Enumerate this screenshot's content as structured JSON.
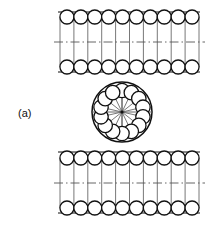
{
  "figure": {
    "label": "(a)",
    "label_x": 18,
    "label_y": 117,
    "caption_text": "(a)",
    "background_color": "#ffffff",
    "stroke_color": "#111111",
    "light_stroke_color": "#555555",
    "centerline_color": "#555555",
    "fill_color": "#ffffff",
    "title": "",
    "type": "line-diagram"
  },
  "chart_data": {
    "type": "diagram",
    "title": "(a)",
    "elements": [
      "upper-raceway-block",
      "central-wheel",
      "lower-raceway-block",
      "figure-label"
    ]
  },
  "upper_block": {
    "name": "upper-raceway-block",
    "x_left": 60,
    "x_right": 199,
    "y_top": 14,
    "y_bottom": 70,
    "roller_count_per_row": 10,
    "roller_radius": 7.0,
    "row_top_cy": 17,
    "row_bottom_cy": 67,
    "centerline_y": 42,
    "column_count": 10,
    "edge_line_top_y": 12,
    "edge_line_bottom_y": 72
  },
  "lower_block": {
    "name": "lower-raceway-block",
    "x_left": 60,
    "x_right": 199,
    "y_top": 155,
    "y_bottom": 211,
    "roller_count_per_row": 10,
    "roller_radius": 7.0,
    "row_top_cy": 158,
    "row_bottom_cy": 208,
    "centerline_y": 183,
    "column_count": 10,
    "edge_line_top_y": 152,
    "edge_line_bottom_y": 213
  },
  "wheel": {
    "name": "central-wheel",
    "center_x": 122,
    "center_y": 112,
    "outer_radius": 30,
    "roller_ring_radius": 21.5,
    "roller_radius": 7.2,
    "roller_count": 14,
    "spoke_count": 14,
    "hub_radius": 1.6,
    "start_angle_deg": -90
  }
}
